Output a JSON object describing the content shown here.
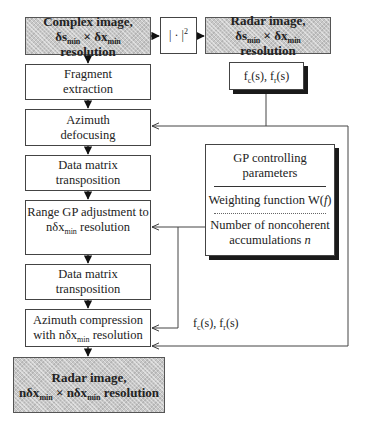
{
  "diagram": {
    "input_box": {
      "line1": "Complex image,",
      "res_a": "δs",
      "res_a_sub": "min",
      "times": " × ",
      "res_b": "δx",
      "res_b_sub": "min",
      "suffix": " resolution"
    },
    "abs_square_box": {
      "base": "| · |",
      "sup": "2"
    },
    "radar_box_top": {
      "line1": "Radar image,",
      "res_a": "δs",
      "res_a_sub": "min",
      "times": " × ",
      "res_b": "δx",
      "res_b_sub": "min",
      "suffix": " resolution"
    },
    "freq_box": {
      "fc": "f",
      "fc_sub": "c",
      "fc_arg": "(s),  ",
      "fr": "f",
      "fr_sub": "r",
      "fr_arg": "(s)"
    },
    "steps": [
      {
        "line1": "Fragment",
        "line2": "extraction"
      },
      {
        "line1": "Azimuth",
        "line2": "defocusing"
      },
      {
        "line1": "Data matrix",
        "line2": "transposition"
      },
      {
        "line1": "Range GP adjustment to",
        "line2_pre": "nδx",
        "line2_sub": "min",
        "line2_post": "  resolution"
      },
      {
        "line1": "Data matrix",
        "line2": "transposition"
      },
      {
        "line1": "Azimuth compression",
        "line2_pre": "with nδx",
        "line2_sub": "min",
        "line2_post": "  resolution"
      }
    ],
    "gp_box": {
      "title1": "GP controlling",
      "title2": "parameters",
      "weighting_pre": "Weighting function W(",
      "weighting_var": "f",
      "weighting_post": ")",
      "noncoh1": "Number of noncoherent",
      "noncoh2_pre": "accumulations  ",
      "noncoh2_var": "n"
    },
    "freq_label": {
      "fc": "f",
      "fc_sub": "c",
      "fc_arg": "(s),  ",
      "fr": "f",
      "fr_sub": "r",
      "fr_arg": "(s)"
    },
    "output_box": {
      "line1": "Radar image,",
      "res_a": "nδx",
      "res_a_sub": "min",
      "times": " × ",
      "res_b": "nδx",
      "res_b_sub": "min",
      "suffix": " resolution"
    }
  }
}
